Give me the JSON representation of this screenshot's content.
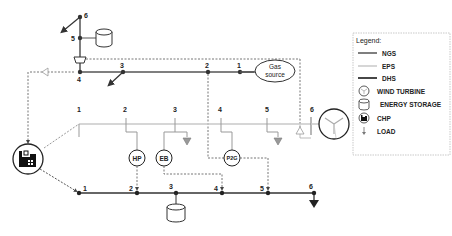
{
  "legend": {
    "title": "Legend:",
    "items": [
      {
        "label": "NGS",
        "type": "line",
        "color": "#555555"
      },
      {
        "label": "EPS",
        "type": "line",
        "color": "#c8c8c8"
      },
      {
        "label": "DHS",
        "type": "line",
        "color": "#333333"
      },
      {
        "label": "WIND TURBINE",
        "type": "icon",
        "icon": "wind-turbine-icon"
      },
      {
        "label": "ENERGY STORAGE",
        "type": "icon",
        "icon": "energy-storage-icon"
      },
      {
        "label": "CHP",
        "type": "icon",
        "icon": "chp-icon"
      },
      {
        "label": "LOAD",
        "type": "icon",
        "icon": "load-icon"
      }
    ]
  },
  "ngs": {
    "nodes": [
      "1",
      "2",
      "3",
      "4",
      "5",
      "6"
    ],
    "gas_source": {
      "line1": "Gas",
      "line2": "source"
    }
  },
  "eps": {
    "nodes": [
      "1",
      "2",
      "3",
      "4",
      "5",
      "6"
    ]
  },
  "dhs": {
    "nodes": [
      "1",
      "2",
      "3",
      "4",
      "5",
      "6"
    ]
  },
  "units": {
    "hp": "HP",
    "eb": "EB",
    "p2g": "P2G"
  },
  "colors": {
    "ngs": "#555555",
    "eps": "#c8c8c8",
    "dhs": "#333333",
    "dotted": "#777777"
  }
}
